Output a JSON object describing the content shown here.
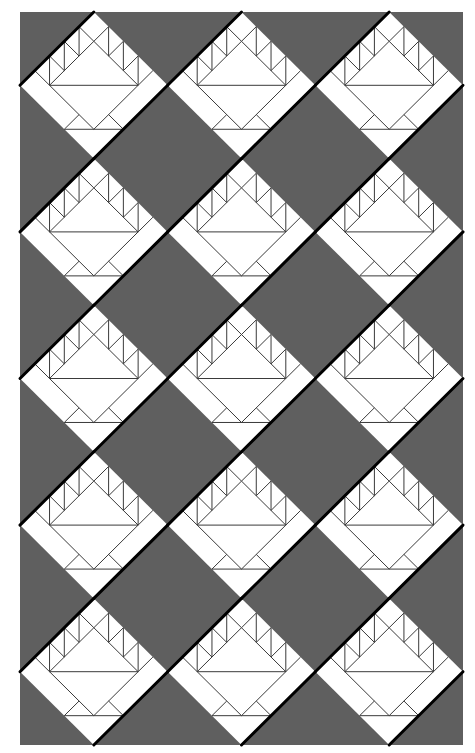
{
  "diagram": {
    "title": "Basket quilt layout",
    "type": "quilt-pattern",
    "canvas": {
      "width": 475,
      "height": 753,
      "background": "#ffffff"
    },
    "quilt": {
      "left": 20,
      "top": 12,
      "right": 463,
      "bottom": 745,
      "rows": 5,
      "cols": 3,
      "setting_fabric_color": "#5f5f5f",
      "block_fabric_color": "#ffffff",
      "seam_line_color": "#3a3a3a",
      "seam_line_width": 1,
      "sashing_line_color": "#000000",
      "sashing_line_width": 3
    },
    "block": {
      "name": "Basket block (on point)",
      "orientation": "diamond",
      "inner_ratio": 0.6,
      "band_ratio": 0.2,
      "band_squares_per_side": 3,
      "elements": [
        "outer-diamond",
        "basket-handle-band-half-square-triangles",
        "basket-top-triangle",
        "basket-body-triangle",
        "basket-foot-triangles",
        "foot-line",
        "thick-upper-left-edge",
        "thick-lower-right-edge"
      ]
    },
    "blocks": [
      {
        "row": 0,
        "col": 0
      },
      {
        "row": 0,
        "col": 1
      },
      {
        "row": 0,
        "col": 2
      },
      {
        "row": 1,
        "col": 0
      },
      {
        "row": 1,
        "col": 1
      },
      {
        "row": 1,
        "col": 2
      },
      {
        "row": 2,
        "col": 0
      },
      {
        "row": 2,
        "col": 1
      },
      {
        "row": 2,
        "col": 2
      },
      {
        "row": 3,
        "col": 0
      },
      {
        "row": 3,
        "col": 1
      },
      {
        "row": 3,
        "col": 2
      },
      {
        "row": 4,
        "col": 0
      },
      {
        "row": 4,
        "col": 1
      },
      {
        "row": 4,
        "col": 2
      }
    ]
  }
}
